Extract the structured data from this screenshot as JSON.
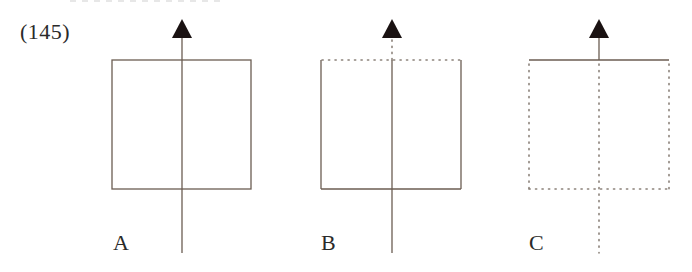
{
  "question": {
    "number": "(145)"
  },
  "colors": {
    "line": "#6b5d52",
    "dotted": "#8a8078",
    "arrow": "#1a1212"
  },
  "panels": [
    {
      "label": "A",
      "description": "Solid square; solid vertical line passes through the square from below to the arrow",
      "box": {
        "x": 112,
        "y": 60,
        "w": 139,
        "h": 129
      },
      "top_edge": "solid",
      "sides": "solid",
      "bottom_edge": "solid",
      "axis": {
        "x": 182,
        "segment_above_box": "solid",
        "segment_in_box": "solid",
        "segment_below_box": "solid"
      }
    },
    {
      "label": "B",
      "description": "Square with dotted top edge; line is dotted above box, solid inside and below",
      "box": {
        "x": 321,
        "y": 60,
        "w": 140,
        "h": 129
      },
      "top_edge": "dotted",
      "sides": "solid",
      "bottom_edge": "solid",
      "axis": {
        "x": 392,
        "segment_above_box": "dotted",
        "segment_in_box": "solid",
        "segment_below_box": "solid"
      }
    },
    {
      "label": "C",
      "description": "Square with solid top edge only; sides, bottom and line within/below box are dotted; line above box solid",
      "box": {
        "x": 529,
        "y": 60,
        "w": 140,
        "h": 129
      },
      "top_edge": "solid",
      "sides": "dotted",
      "bottom_edge": "dotted",
      "axis": {
        "x": 599,
        "segment_above_box": "solid",
        "segment_in_box": "dotted",
        "segment_below_box": "dotted"
      }
    }
  ]
}
